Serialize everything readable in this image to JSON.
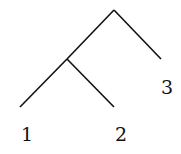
{
  "diagram": {
    "type": "binary-tree",
    "root": {
      "x": 114,
      "y": 10
    },
    "internal_node": {
      "x": 67,
      "y": 59
    },
    "edges": [
      {
        "name": "edge-root-internal",
        "x1": 114,
        "y1": 10,
        "x2": 67,
        "y2": 59
      },
      {
        "name": "edge-root-leaf-3",
        "x1": 114,
        "y1": 10,
        "x2": 161,
        "y2": 59
      },
      {
        "name": "edge-internal-leaf-1",
        "x1": 67,
        "y1": 59,
        "x2": 20,
        "y2": 107
      },
      {
        "name": "edge-internal-leaf-2",
        "x1": 67,
        "y1": 59,
        "x2": 114,
        "y2": 107
      }
    ],
    "leaves": [
      {
        "label": "1",
        "x": 27,
        "y": 141
      },
      {
        "label": "2",
        "x": 121,
        "y": 141
      },
      {
        "label": "3",
        "x": 167,
        "y": 94
      }
    ]
  }
}
